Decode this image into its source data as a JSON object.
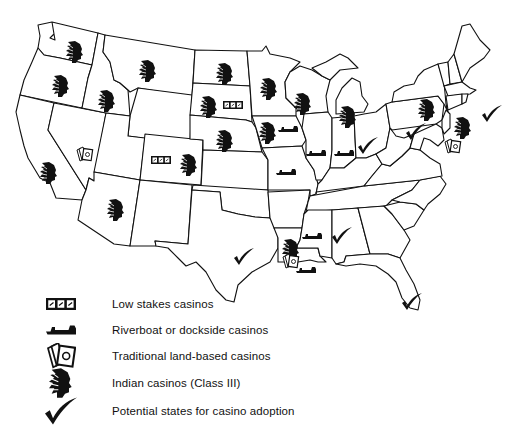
{
  "map": {
    "title": "US casino gaming map",
    "region": "Contiguous United States",
    "colors": {
      "outline": "#111111",
      "fill": "#ffffff",
      "icon": "#111111"
    }
  },
  "legend": {
    "items": [
      {
        "icon": "low-stakes-icon",
        "label": "Low stakes casinos"
      },
      {
        "icon": "riverboat-icon",
        "label": "Riverboat or dockside casinos"
      },
      {
        "icon": "cards-icon",
        "label": "Traditional land-based casinos"
      },
      {
        "icon": "indian-head-icon",
        "label": "Indian casinos (Class III)"
      },
      {
        "icon": "checkmark-icon",
        "label": "Potential states for casino adoption"
      }
    ]
  },
  "states": [
    {
      "name": "Washington",
      "markers": [
        "indian-head-icon"
      ]
    },
    {
      "name": "Oregon",
      "markers": [
        "indian-head-icon"
      ]
    },
    {
      "name": "Idaho",
      "markers": [
        "indian-head-icon"
      ]
    },
    {
      "name": "Montana",
      "markers": [
        "indian-head-icon"
      ]
    },
    {
      "name": "North Dakota",
      "markers": [
        "indian-head-icon"
      ]
    },
    {
      "name": "South Dakota",
      "markers": [
        "indian-head-icon",
        "low-stakes-icon"
      ]
    },
    {
      "name": "Nebraska",
      "markers": [
        "indian-head-icon"
      ]
    },
    {
      "name": "Minnesota",
      "markers": [
        "indian-head-icon"
      ]
    },
    {
      "name": "Wisconsin",
      "markers": [
        "indian-head-icon"
      ]
    },
    {
      "name": "Michigan",
      "markers": [
        "indian-head-icon"
      ]
    },
    {
      "name": "Iowa",
      "markers": [
        "indian-head-icon",
        "riverboat-icon"
      ]
    },
    {
      "name": "Illinois",
      "markers": [
        "riverboat-icon"
      ]
    },
    {
      "name": "Indiana",
      "markers": [
        "riverboat-icon"
      ]
    },
    {
      "name": "Missouri",
      "markers": [
        "riverboat-icon"
      ]
    },
    {
      "name": "Ohio",
      "markers": [
        "checkmark-icon"
      ]
    },
    {
      "name": "Pennsylvania",
      "markers": [
        "checkmark-icon"
      ]
    },
    {
      "name": "New York",
      "markers": [
        "indian-head-icon"
      ]
    },
    {
      "name": "Connecticut",
      "markers": [
        "indian-head-icon"
      ]
    },
    {
      "name": "Massachusetts",
      "markers": [
        "checkmark-icon"
      ]
    },
    {
      "name": "New Jersey",
      "markers": [
        "cards-icon"
      ]
    },
    {
      "name": "California",
      "markers": [
        "indian-head-icon"
      ]
    },
    {
      "name": "Nevada",
      "markers": [
        "cards-icon"
      ]
    },
    {
      "name": "Colorado",
      "markers": [
        "low-stakes-icon",
        "indian-head-icon"
      ]
    },
    {
      "name": "Arizona",
      "markers": [
        "indian-head-icon"
      ]
    },
    {
      "name": "Texas",
      "markers": [
        "checkmark-icon"
      ]
    },
    {
      "name": "Louisiana",
      "markers": [
        "indian-head-icon",
        "cards-icon",
        "riverboat-icon"
      ]
    },
    {
      "name": "Mississippi",
      "markers": [
        "riverboat-icon"
      ]
    },
    {
      "name": "Alabama",
      "markers": [
        "checkmark-icon"
      ]
    },
    {
      "name": "Florida",
      "markers": [
        "checkmark-icon"
      ]
    }
  ]
}
